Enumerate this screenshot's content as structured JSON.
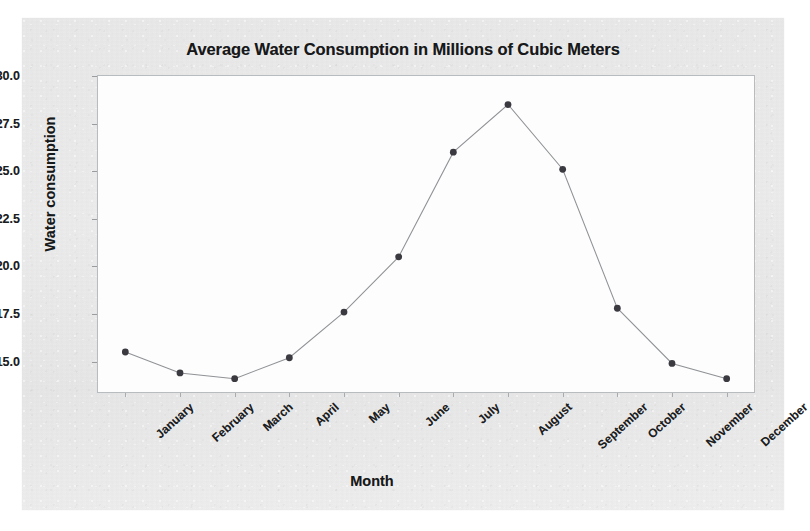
{
  "chart_data": {
    "type": "line",
    "title": "Average Water Consumption in Millions of Cubic Meters",
    "xlabel": "Month",
    "ylabel": "Water consumption",
    "categories": [
      "January",
      "February",
      "March",
      "April",
      "May",
      "June",
      "July",
      "August",
      "September",
      "October",
      "November",
      "December"
    ],
    "values": [
      15.5,
      14.4,
      14.1,
      15.2,
      17.6,
      20.5,
      26.0,
      28.5,
      25.1,
      17.8,
      14.9,
      14.1
    ],
    "ytick_labels": [
      "30.0",
      "27.5",
      "25.0",
      "22.5",
      "20.0",
      "17.5",
      "15.0"
    ],
    "ytick_values": [
      30.0,
      27.5,
      25.0,
      22.5,
      20.0,
      17.5,
      15.0
    ],
    "ylim": [
      13.4,
      30.0
    ],
    "grid": false,
    "legend": "none",
    "marker": "filled-circle",
    "marker_color": "#3a3a40",
    "line_color": "#8f9296",
    "xtick_rotation": -42
  }
}
